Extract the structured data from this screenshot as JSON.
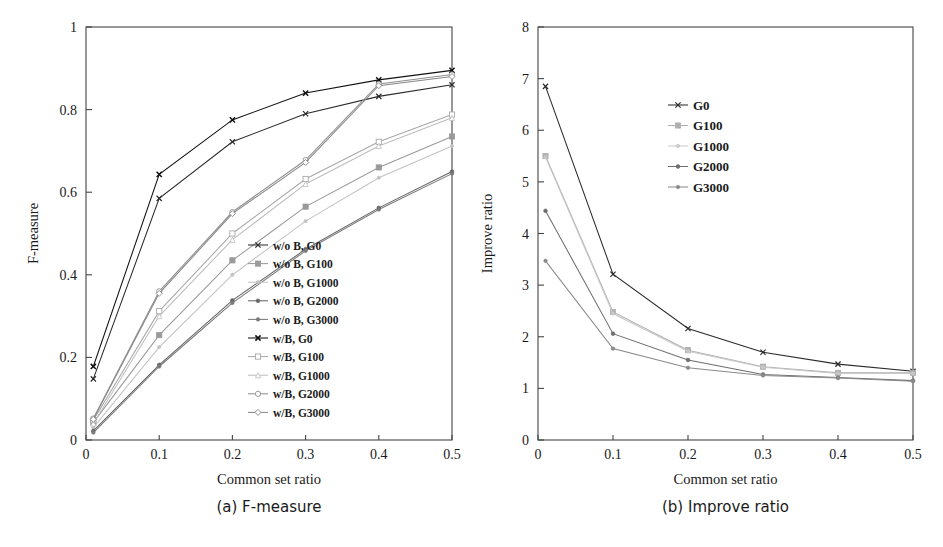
{
  "figure": {
    "panels": [
      {
        "id": "a",
        "caption": "(a) F-measure",
        "xlabel": "Common set ratio",
        "ylabel": "F-measure",
        "xticks": [
          "0",
          "0.1",
          "0.2",
          "0.3",
          "0.4",
          "0.5"
        ],
        "yticks": [
          "0",
          "0.2",
          "0.4",
          "0.6",
          "0.8",
          "1"
        ]
      },
      {
        "id": "b",
        "caption": "(b) Improve ratio",
        "xlabel": "Common set ratio",
        "ylabel": "Improve ratio",
        "xticks": [
          "0",
          "0.1",
          "0.2",
          "0.3",
          "0.4",
          "0.5"
        ],
        "yticks": [
          "0",
          "1",
          "2",
          "3",
          "4",
          "5",
          "6",
          "7",
          "8"
        ]
      }
    ]
  },
  "chart_data": [
    {
      "type": "line",
      "title": "(a) F-measure",
      "xlabel": "Common set ratio",
      "ylabel": "F-measure",
      "xlim": [
        0,
        0.5
      ],
      "ylim": [
        0,
        1
      ],
      "xticks": [
        0,
        0.1,
        0.2,
        0.3,
        0.4,
        0.5
      ],
      "yticks": [
        0,
        0.2,
        0.4,
        0.6,
        0.8,
        1
      ],
      "grid": false,
      "legend_position": "inside-lower-right",
      "x": [
        0.01,
        0.1,
        0.2,
        0.3,
        0.4,
        0.5
      ],
      "series": [
        {
          "name": "w/o B, G0",
          "marker": "cross",
          "color": "#2b2b2b",
          "values": [
            0.148,
            0.585,
            0.722,
            0.79,
            0.832,
            0.86
          ]
        },
        {
          "name": "w/o B, G100",
          "marker": "square-solid",
          "color": "#9a9a9a",
          "values": [
            0.042,
            0.254,
            0.435,
            0.565,
            0.66,
            0.735
          ]
        },
        {
          "name": "w/o B, G1000",
          "marker": "dot-light",
          "color": "#c3c3c3",
          "values": [
            0.03,
            0.225,
            0.4,
            0.53,
            0.635,
            0.712
          ]
        },
        {
          "name": "w/o B, G2000",
          "marker": "dot-solid",
          "color": "#666666",
          "values": [
            0.022,
            0.182,
            0.338,
            0.462,
            0.562,
            0.65
          ]
        },
        {
          "name": "w/o B, G3000",
          "marker": "dot-mid",
          "color": "#7a7a7a",
          "values": [
            0.018,
            0.178,
            0.332,
            0.458,
            0.558,
            0.645
          ]
        },
        {
          "name": "w/B, G0",
          "marker": "cross-bold",
          "color": "#111111",
          "values": [
            0.178,
            0.643,
            0.775,
            0.84,
            0.872,
            0.895
          ]
        },
        {
          "name": "w/B, G100",
          "marker": "square-open",
          "color": "#a8a8a8",
          "values": [
            0.048,
            0.312,
            0.5,
            0.632,
            0.722,
            0.788
          ]
        },
        {
          "name": "w/B, G1000",
          "marker": "tri-open",
          "color": "#bdbdbd",
          "values": [
            0.04,
            0.3,
            0.485,
            0.62,
            0.712,
            0.78
          ]
        },
        {
          "name": "w/B, G2000",
          "marker": "circle-open",
          "color": "#8f8f8f",
          "values": [
            0.052,
            0.36,
            0.552,
            0.678,
            0.862,
            0.885
          ]
        },
        {
          "name": "w/B, G3000",
          "marker": "diamond-open",
          "color": "#888888",
          "values": [
            0.05,
            0.355,
            0.548,
            0.672,
            0.858,
            0.88
          ]
        }
      ]
    },
    {
      "type": "line",
      "title": "(b) Improve ratio",
      "xlabel": "Common set ratio",
      "ylabel": "Improve ratio",
      "xlim": [
        0,
        0.5
      ],
      "ylim": [
        0,
        8
      ],
      "xticks": [
        0,
        0.1,
        0.2,
        0.3,
        0.4,
        0.5
      ],
      "yticks": [
        0,
        1,
        2,
        3,
        4,
        5,
        6,
        7,
        8
      ],
      "grid": false,
      "legend_position": "inside-upper-right",
      "x": [
        0.01,
        0.1,
        0.2,
        0.3,
        0.4,
        0.5
      ],
      "series": [
        {
          "name": "G0",
          "marker": "cross",
          "color": "#2b2b2b",
          "values": [
            6.85,
            3.21,
            2.16,
            1.7,
            1.47,
            1.33
          ]
        },
        {
          "name": "G100",
          "marker": "square-solid",
          "color": "#b0b0b0",
          "values": [
            5.5,
            2.48,
            1.74,
            1.42,
            1.3,
            1.3
          ]
        },
        {
          "name": "G1000",
          "marker": "dot-light",
          "color": "#c8c8c8",
          "values": [
            5.48,
            2.45,
            1.72,
            1.41,
            1.29,
            1.29
          ]
        },
        {
          "name": "G2000",
          "marker": "dot-solid",
          "color": "#6e6e6e",
          "values": [
            4.44,
            2.06,
            1.55,
            1.27,
            1.21,
            1.15
          ]
        },
        {
          "name": "G3000",
          "marker": "dot-mid",
          "color": "#8a8a8a",
          "values": [
            3.47,
            1.77,
            1.4,
            1.25,
            1.2,
            1.14
          ]
        }
      ]
    }
  ]
}
